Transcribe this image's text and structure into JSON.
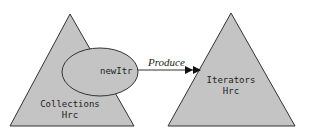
{
  "diagram": {
    "nodes": [
      {
        "id": "collections",
        "shape": "triangle",
        "label_line1": "Collections",
        "label_line2": "Hrc",
        "fill": "#c4c4c4"
      },
      {
        "id": "newItr",
        "shape": "ellipse",
        "label": "newItr",
        "fill": "#c4c4c4"
      },
      {
        "id": "iterators",
        "shape": "triangle",
        "label_line1": "Iterators",
        "label_line2": "Hrc",
        "fill": "#c4c4c4"
      }
    ],
    "edges": [
      {
        "from": "newItr",
        "to": "iterators",
        "label": "Produce",
        "arrowhead": "double-filled"
      }
    ],
    "colors": {
      "shape_fill": "#c4c4c4",
      "stroke": "#333333",
      "background": "#ffffff"
    }
  }
}
